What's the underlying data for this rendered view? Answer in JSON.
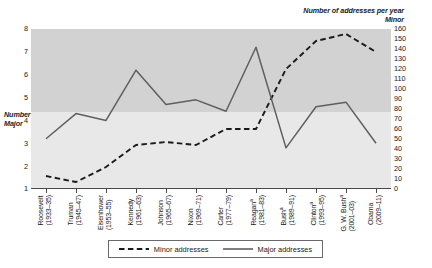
{
  "chart_data": {
    "type": "line",
    "title": "",
    "categories": [
      "Roosevelt (1933–35)",
      "Truman (1945–47)",
      "Eisenhower (1953–55)",
      "Kennedy (1961–63)",
      "Johnson (1965–67)",
      "Nixon (1969–71)",
      "Carter (1977–79)",
      "Reagan (1981–83)",
      "Bush (1989–91)",
      "Clinton (1993–95)",
      "G. W. Bush (2001–03)",
      "Obama (2009–11)"
    ],
    "x_tick_labels": [
      {
        "name": "Roosevelt",
        "years": "(1933–35)",
        "note": ""
      },
      {
        "name": "Truman",
        "years": "(1945–47)",
        "note": ""
      },
      {
        "name": "Eisenhower",
        "years": "(1953–55)",
        "note": ""
      },
      {
        "name": "Kennedy",
        "years": "(1961–63)",
        "note": ""
      },
      {
        "name": "Johnson",
        "years": "(1965–67)",
        "note": ""
      },
      {
        "name": "Nixon",
        "years": "(1969–71)",
        "note": ""
      },
      {
        "name": "Carter",
        "years": "(1977–79)",
        "note": ""
      },
      {
        "name": "Reagan",
        "years": "(1981–83)",
        "note": "a"
      },
      {
        "name": "Bush",
        "years": "(1989–91)",
        "note": "a"
      },
      {
        "name": "Clinton",
        "years": "(1993–95)",
        "note": "a"
      },
      {
        "name": "G. W. Bush",
        "years": "(2001–03)",
        "note": "a"
      },
      {
        "name": "Obama",
        "years": "(2009–11)",
        "note": ""
      }
    ],
    "series": [
      {
        "name": "Minor addresses",
        "axis": "right",
        "style": "dashed",
        "color": "#1a1a1a",
        "values": [
          13,
          7,
          22,
          44,
          47,
          44,
          60,
          60,
          120,
          148,
          155,
          137
        ]
      },
      {
        "name": "Major addresses",
        "axis": "left",
        "style": "solid",
        "color": "#5a5a5a",
        "values": [
          3.2,
          4.3,
          4.0,
          6.2,
          4.7,
          4.9,
          4.4,
          7.2,
          2.8,
          4.6,
          4.8,
          3.0
        ]
      }
    ],
    "left_axis": {
      "title_line1": "Number of addresses per year",
      "title_line2": "Major",
      "ticks": [
        8,
        7,
        6,
        5,
        4,
        3,
        2,
        1
      ],
      "min": 1,
      "max": 8
    },
    "right_axis": {
      "title_line1": "Number of addresses per year",
      "title_line2": "Minor",
      "ticks": [
        160,
        150,
        140,
        130,
        120,
        110,
        100,
        90,
        80,
        70,
        60,
        50,
        40,
        30,
        20,
        10,
        0
      ],
      "min": 0,
      "max": 160
    },
    "legend": {
      "position": "bottom-center",
      "entries": [
        {
          "label": "Minor addresses",
          "style": "dashed"
        },
        {
          "label": "Major addresses",
          "style": "solid"
        }
      ]
    },
    "grid": false,
    "xlabel": "",
    "ylabel": "Number of addresses per year"
  }
}
